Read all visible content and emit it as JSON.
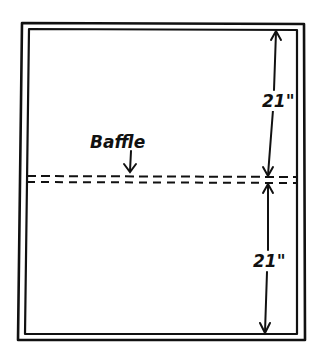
{
  "diagram": {
    "labels": {
      "baffle": "Baffle",
      "top_dimension": "21\"",
      "bottom_dimension": "21\""
    },
    "colors": {
      "ink": "#111111",
      "background": "#ffffff"
    }
  }
}
